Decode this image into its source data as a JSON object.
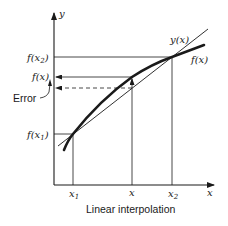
{
  "diagram": {
    "caption": "Linear interpolation",
    "axes": {
      "y_label": "y",
      "x_label": "x"
    },
    "y_ticks": [
      {
        "base": "f(x",
        "sub": "2",
        "close": ")"
      },
      {
        "base": "f(x)",
        "sub": "",
        "close": ""
      },
      {
        "base": "f(x",
        "sub": "1",
        "close": ")"
      }
    ],
    "x_ticks": [
      {
        "base": "x",
        "sub": "1"
      },
      {
        "base": "x",
        "sub": ""
      },
      {
        "base": "x",
        "sub": "2"
      }
    ],
    "curve_labels": {
      "line": "y(x)",
      "curve": "f(x)"
    },
    "error_label": "Error",
    "colors": {
      "ink": "#1a1a1a",
      "background": "#ffffff"
    }
  }
}
